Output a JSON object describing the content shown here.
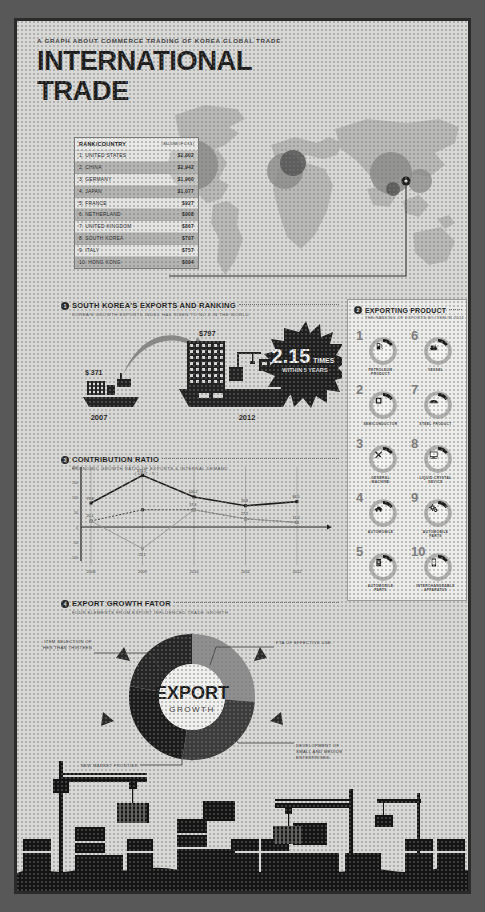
{
  "header": {
    "kicker": "A GRAPH ABOUT COMMERCE TRADING OF KOREA GLOBAL TRADE",
    "title": "INTERNATIONAL TRADE"
  },
  "rank_table": {
    "col1_header": "RANK/COUNTRY",
    "col2_header": "( BILLIONS OF U.S.$ )",
    "rows": [
      {
        "rank": "1.",
        "country": "UNITED STATES",
        "value": "$2,802"
      },
      {
        "rank": "2.",
        "country": "CHINA",
        "value": "$2,942"
      },
      {
        "rank": "3.",
        "country": "GERMANY",
        "value": "$1,960"
      },
      {
        "rank": "4.",
        "country": "JAPAN",
        "value": "$1,077"
      },
      {
        "rank": "5.",
        "country": "FRANCE",
        "value": "$927"
      },
      {
        "rank": "6.",
        "country": "NETHERLAND",
        "value": "$908"
      },
      {
        "rank": "7.",
        "country": "UNITED KINGDOM",
        "value": "$867"
      },
      {
        "rank": "8.",
        "country": "SOUTH KOREA",
        "value": "$797"
      },
      {
        "rank": "9.",
        "country": "ITALY",
        "value": "$757"
      },
      {
        "rank": "10.",
        "country": "HONG KONG",
        "value": "$694"
      }
    ]
  },
  "section_exports": {
    "number": "1",
    "title": "SOUTH KOREA'S EXPORTS AND RANKING",
    "subtitle": "KOREA'S GROWTH EXPORTS INDEX HAS RISEN TO NO.8 IN THE WORLD",
    "year_from": "2007",
    "year_to": "2012",
    "value_from": "$ 371",
    "value_to": "$797",
    "badge_number": "2.15",
    "badge_unit": "TIMES",
    "badge_note": "WITHIN 5 YEARS"
  },
  "section_products": {
    "number": "2",
    "title": "EXPORTING PRODUCT",
    "subtitle": "THE RANKING OF EXPORTS BY ITEM IN 2012",
    "items": [
      {
        "rank": "1",
        "label": "PETROLEUM\nPRODUCT",
        "icon": "fuel-pump-icon"
      },
      {
        "rank": "6",
        "label": "VESSEL",
        "icon": "ship-icon"
      },
      {
        "rank": "2",
        "label": "SEMICONDUCTOR",
        "icon": "chip-icon"
      },
      {
        "rank": "7",
        "label": "STEEL PRODUCT",
        "icon": "steel-coil-icon"
      },
      {
        "rank": "3",
        "label": "GENERAL\nMACHINE",
        "icon": "tools-icon"
      },
      {
        "rank": "8",
        "label": "LIQUID CRYSTAL\nDEVICE",
        "icon": "monitor-icon"
      },
      {
        "rank": "4",
        "label": "AUTOMOBILE",
        "icon": "car-icon"
      },
      {
        "rank": "9",
        "label": "AUTOMOBILE\nPARTS",
        "icon": "gears-icon"
      },
      {
        "rank": "5",
        "label": "AUTOMOBILE\nPARTS",
        "icon": "oil-drum-icon"
      },
      {
        "rank": "10",
        "label": "INTERCHANGEABLE\nAPPARATUS",
        "icon": "smartphone-icon"
      }
    ]
  },
  "section_contribution": {
    "number": "3",
    "title": "CONTRIBUTION RATIO",
    "subtitle": "ECONOMIC GROWTH RATIO OF EXPORTS & INTERNAL DEMAND",
    "unit_label": "( UNIT : % )"
  },
  "chart_data": {
    "type": "line",
    "title": "CONTRIBUTION RATIO",
    "xlabel": "",
    "ylabel": "( UNIT : % )",
    "x": [
      "2008",
      "2009",
      "2010",
      "2011",
      "2012"
    ],
    "ylim": [
      -100,
      200
    ],
    "yticks": [
      "200",
      "150",
      "100",
      "50",
      "0",
      "-50",
      "-100"
    ],
    "grid": true,
    "legend": "",
    "series": [
      {
        "name": "EXPORTS",
        "values": [
          79.8,
          172.1,
          100.2,
          70.8,
          84.5
        ],
        "style": "solid"
      },
      {
        "name": "INTERNAL DEMAND",
        "values": [
          20.1,
          57.4,
          57.4,
          27.2,
          15.4
        ],
        "style": "dotted"
      },
      {
        "name": "GROWTH",
        "values": [
          20.1,
          -72.1,
          57.4,
          27.2,
          15.4
        ],
        "style": "thin"
      }
    ],
    "point_labels": {
      "upper": [
        "79.8",
        "172.1",
        "100.2",
        "70.8",
        "84.5"
      ],
      "lower": [
        "20.1",
        "-72.1",
        "57.4",
        "27.2",
        "15.4"
      ]
    }
  },
  "section_growth": {
    "number": "4",
    "title": "EXPORT GROWTH FATOR",
    "subtitle": "FOUR ELEMENTS FROM EXPORT INFLUENCED TRADE GROWTH",
    "center_line1": "EXPORT",
    "center_line2": "GROWTH",
    "callouts": [
      {
        "text": "FTA OF EFFECTIVE USE.",
        "pos": "top-right"
      },
      {
        "text": "ITEM SELECTION OF\nOTHER THAN THIRTEEN",
        "pos": "top-left"
      },
      {
        "text": "DEVELOPMENT OF\nSMALL AND MEDIUM\nENTERPRISES",
        "pos": "bottom-right"
      },
      {
        "text": "NEW MARKET FRONTIER",
        "pos": "bottom-left"
      }
    ],
    "segments": [
      {
        "label": "FTA OF EFFECTIVE USE.",
        "color": "#8f8f8f"
      },
      {
        "label": "DEVELOPMENT OF SMALL AND MEDIUM ENTERPRISES",
        "color": "#3c3c3c"
      },
      {
        "label": "NEW MARKET FRONTIER",
        "color": "#262626"
      },
      {
        "label": "ITEM SELECTION OF OTHER THAN THIRTEEN",
        "color": "#1c1c1c"
      }
    ]
  },
  "colors": {
    "paper": "#d8d8d6",
    "ink": "#1d1d1d",
    "mid_gray": "#8f8f8f",
    "frame": "#2b2b2b"
  }
}
